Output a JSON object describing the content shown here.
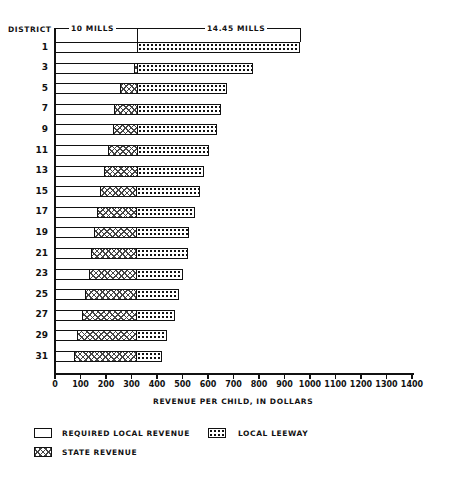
{
  "chart_data": {
    "type": "bar",
    "orientation": "horizontal",
    "stacked": true,
    "title": "",
    "ylabel": "DISTRICT",
    "xlabel": "REVENUE PER CHILD, IN DOLLARS",
    "xlim": [
      0,
      1400
    ],
    "x_ticks": [
      "0",
      "100",
      "200",
      "300",
      "400",
      "500",
      "600",
      "700",
      "800",
      "900",
      "1000",
      "1100",
      "1200",
      "1300",
      "1400"
    ],
    "categories": [
      "1",
      "3",
      "5",
      "7",
      "9",
      "11",
      "13",
      "15",
      "17",
      "19",
      "21",
      "23",
      "25",
      "27",
      "29",
      "31"
    ],
    "series": [
      {
        "name": "REQUIRED LOCAL REVENUE",
        "pattern": "blank",
        "values": [
          320,
          310,
          255,
          230,
          225,
          205,
          190,
          175,
          165,
          150,
          140,
          130,
          115,
          105,
          85,
          70
        ]
      },
      {
        "name": "STATE REVENUE",
        "pattern": "crosshatch",
        "values": [
          0,
          10,
          65,
          90,
          95,
          115,
          130,
          145,
          155,
          170,
          180,
          190,
          205,
          215,
          235,
          250
        ]
      },
      {
        "name": "LOCAL LEEWAY",
        "pattern": "dotted",
        "values": [
          640,
          455,
          355,
          330,
          315,
          285,
          265,
          250,
          230,
          205,
          200,
          180,
          165,
          150,
          120,
          100
        ]
      }
    ],
    "totals": [
      960,
      775,
      675,
      650,
      635,
      605,
      585,
      570,
      550,
      525,
      520,
      500,
      485,
      470,
      440,
      420
    ],
    "annotations": [
      {
        "text": "10 MILLS",
        "span": [
          0,
          320
        ]
      },
      {
        "text": "14.45 MILLS",
        "span": [
          320,
          960
        ]
      }
    ],
    "legend": [
      "REQUIRED LOCAL REVENUE",
      "LOCAL LEEWAY",
      "STATE REVENUE"
    ],
    "legend_position": "bottom",
    "grid": false
  },
  "labels": {
    "district_header": "DISTRICT",
    "ten_mills": "10 MILLS",
    "fourteen_mills": "14.45 MILLS",
    "xlabel": "REVENUE PER CHILD, IN DOLLARS",
    "legend_required": "REQUIRED LOCAL REVENUE",
    "legend_state": "STATE REVENUE",
    "legend_leeway": "LOCAL LEEWAY"
  }
}
